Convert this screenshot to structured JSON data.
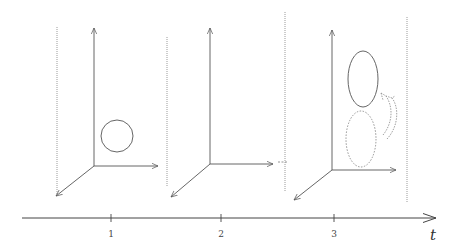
{
  "diagram": {
    "colors": {
      "stroke": "#555555",
      "dotted": "#9a9a9a",
      "background": "#ffffff"
    },
    "timeline": {
      "axis_label": "t",
      "ticks": [
        {
          "label": "1",
          "x": 111
        },
        {
          "label": "2",
          "x": 221
        },
        {
          "label": "3",
          "x": 334
        }
      ]
    },
    "panels": [
      {
        "id": "panel-1",
        "time": "1",
        "content": "circle"
      },
      {
        "id": "panel-2",
        "time": "2",
        "content": "empty"
      },
      {
        "id": "panel-3",
        "time": "3",
        "content": "ellipse-moved-up-from-dashed-position"
      }
    ]
  }
}
